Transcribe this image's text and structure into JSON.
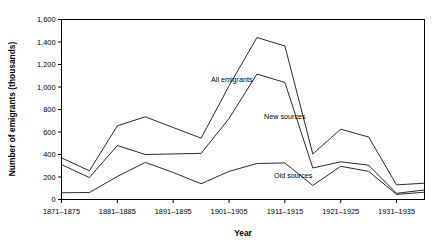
{
  "chart_data": {
    "type": "line",
    "title": "",
    "xlabel": "Year",
    "ylabel": "Number of emigrants (thousands)",
    "categories": [
      "1871–1875",
      "1876–1880",
      "1881–1885",
      "1886–1890",
      "1891–1895",
      "1896–1900",
      "1901–1905",
      "1906–1910",
      "1911–1915",
      "1916–1920",
      "1921–1925",
      "1926–1930",
      "1931–1935",
      "1936–1940"
    ],
    "x_tick_labels": [
      "1871–1875",
      "1881–1885",
      "1891–1895",
      "1901–1905",
      "1911–1915",
      "1921–1925",
      "1931–1935"
    ],
    "y_tick_labels": [
      "0",
      "200",
      "400",
      "600",
      "800",
      "1,000",
      "1,200",
      "1,400",
      "1,600"
    ],
    "y_tick_values": [
      0,
      200,
      400,
      600,
      800,
      1000,
      1200,
      1400,
      1600
    ],
    "ylim": [
      0,
      1600
    ],
    "grid": false,
    "legend_position": "inline-annotations",
    "series": [
      {
        "name": "All emigrants",
        "annotation_label": "All emigrants",
        "color": "#2b2b2b",
        "values": [
          370,
          255,
          655,
          735,
          640,
          545,
          1010,
          1440,
          1365,
          405,
          625,
          555,
          130,
          145
        ]
      },
      {
        "name": "New sources",
        "annotation_label": "New sources",
        "color": "#2b2b2b",
        "values": [
          310,
          195,
          480,
          400,
          405,
          410,
          720,
          1115,
          1040,
          280,
          335,
          305,
          55,
          85
        ]
      },
      {
        "name": "Old sources",
        "annotation_label": "Old sources",
        "color": "#2b2b2b",
        "values": [
          60,
          62,
          205,
          330,
          240,
          140,
          250,
          320,
          325,
          125,
          295,
          250,
          45,
          65
        ]
      }
    ],
    "annotations": [
      {
        "text": "All emigrants",
        "x_index": 6.1,
        "y_value": 1070
      },
      {
        "text": "New sources",
        "x_index": 8.0,
        "y_value": 740
      },
      {
        "text": "Old sources",
        "x_index": 8.3,
        "y_value": 215
      }
    ]
  },
  "axis": {
    "x_title": "Year",
    "y_title": "Number of emigrants (thousands)"
  }
}
